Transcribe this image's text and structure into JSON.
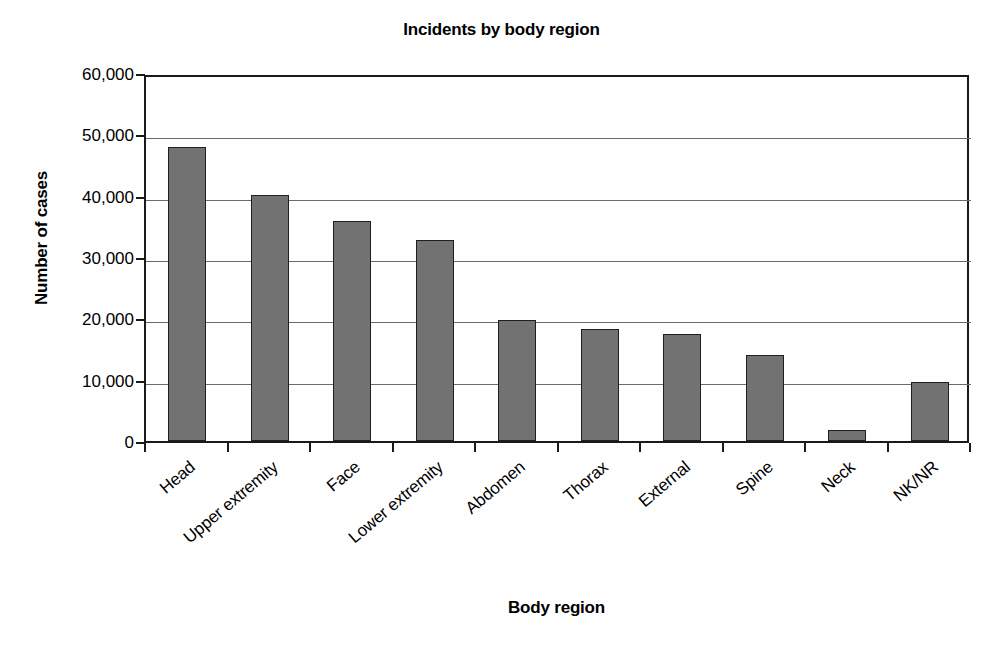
{
  "chart_data": {
    "type": "bar",
    "title": "Incidents by body region",
    "xlabel": "Body region",
    "ylabel": "Number of cases",
    "categories": [
      "Head",
      "Upper extremity",
      "Face",
      "Lower extremity",
      "Abdomen",
      "Thorax",
      "External",
      "Spine",
      "Neck",
      "NK/NR"
    ],
    "values": [
      47900,
      40100,
      35900,
      32800,
      19700,
      18300,
      17400,
      14000,
      1800,
      9700
    ],
    "ylim": [
      0,
      60000
    ],
    "ytick_labels": [
      "60,000",
      "50,000",
      "40,000",
      "30,000",
      "20,000",
      "10,000",
      "0"
    ],
    "ytick_values": [
      60000,
      50000,
      40000,
      30000,
      20000,
      10000,
      0
    ],
    "grid": true,
    "legend": "none",
    "series": [
      {
        "name": "Number of cases",
        "values": [
          47900,
          40100,
          35900,
          32800,
          19700,
          18300,
          17400,
          14000,
          1800,
          9700
        ]
      }
    ],
    "bar_color": "#727272",
    "bar_edge_color": "#1f1f1f",
    "axis_color": "#1a1a1a",
    "grid_color": "#6b6b6b",
    "background": "#ffffff"
  }
}
